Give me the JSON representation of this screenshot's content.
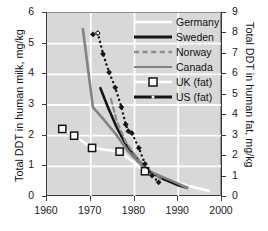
{
  "chart_data": {
    "type": "line",
    "title": "",
    "xlabel": "",
    "ylabel": "Total DDT in human milk, mg/kg",
    "y2label": "Total DDT in human fat, mg/kg",
    "xlim": [
      1960,
      2000
    ],
    "ylim": [
      0,
      6
    ],
    "y2lim": [
      0,
      9
    ],
    "xticks": [
      "1960",
      "1970",
      "1980",
      "1990",
      "2000"
    ],
    "yticks": [
      "0",
      "1",
      "2",
      "3",
      "4",
      "5",
      "6"
    ],
    "y2ticks": [
      "0",
      "1",
      "2",
      "3",
      "4",
      "5",
      "6",
      "7",
      "8",
      "9"
    ],
    "grid": true,
    "legend_position": "top-right",
    "plot_background": "#d8d8d8",
    "gridline_color": "#ffffff",
    "series": [
      {
        "name": "Germany",
        "axis": "left",
        "style": "solid",
        "color": "#ffffff",
        "width": 2.6,
        "marker": "none",
        "points": [
          [
            1963.5,
            2.22
          ],
          [
            1966.2,
            2.0
          ],
          [
            1970.3,
            1.6
          ],
          [
            1976.6,
            1.48
          ],
          [
            1982.4,
            0.84
          ],
          [
            1985.5,
            0.7
          ],
          [
            1988.0,
            0.56
          ],
          [
            1991.0,
            0.42
          ],
          [
            1994.0,
            0.3
          ],
          [
            1997.0,
            0.2
          ]
        ]
      },
      {
        "name": "Sweden",
        "axis": "left",
        "style": "solid",
        "color": "#141414",
        "width": 2.6,
        "marker": "none",
        "points": [
          [
            1972.2,
            3.55
          ],
          [
            1974.0,
            2.9
          ],
          [
            1976.0,
            2.25
          ],
          [
            1978.0,
            1.72
          ],
          [
            1980.0,
            1.34
          ],
          [
            1982.0,
            1.02
          ],
          [
            1984.0,
            0.78
          ],
          [
            1986.0,
            0.62
          ],
          [
            1988.0,
            0.5
          ],
          [
            1990.0,
            0.38
          ],
          [
            1992.0,
            0.3
          ]
        ]
      },
      {
        "name": "Norway",
        "axis": "left",
        "style": "dashed",
        "color": "#8c8c8c",
        "width": 2.2,
        "marker": "none",
        "points": [
          [
            1974.6,
            3.2
          ],
          [
            1976.0,
            2.45
          ],
          [
            1978.0,
            1.8
          ],
          [
            1980.0,
            1.4
          ],
          [
            1982.0,
            1.02
          ],
          [
            1984.0,
            0.78
          ],
          [
            1986.0,
            0.58
          ]
        ]
      },
      {
        "name": "Canada",
        "axis": "left",
        "style": "solid",
        "color": "#838383",
        "width": 2.6,
        "marker": "none",
        "points": [
          [
            1968.2,
            5.48
          ],
          [
            1970.5,
            2.92
          ],
          [
            1973.0,
            2.52
          ],
          [
            1976.0,
            2.0
          ],
          [
            1978.5,
            1.5
          ],
          [
            1981.0,
            1.12
          ],
          [
            1983.0,
            0.86
          ],
          [
            1986.0,
            0.68
          ],
          [
            1989.0,
            0.5
          ],
          [
            1992.0,
            0.3
          ]
        ]
      },
      {
        "name": "UK (fat)",
        "axis": "left",
        "style": "none",
        "color": "#141414",
        "width": 1.4,
        "marker": "square-open",
        "points": [
          [
            1963.5,
            2.22
          ],
          [
            1966.2,
            2.0
          ],
          [
            1970.3,
            1.6
          ],
          [
            1976.6,
            1.48
          ],
          [
            1982.4,
            0.84
          ]
        ]
      },
      {
        "name": "US (fat)",
        "axis": "right",
        "style": "dash-dot",
        "color": "#141414",
        "width": 2.4,
        "marker": "diamond",
        "points": [
          [
            1970.5,
            7.95
          ],
          [
            1971.6,
            8.02
          ],
          [
            1972.8,
            7.0
          ],
          [
            1974.2,
            6.1
          ],
          [
            1975.6,
            5.35
          ],
          [
            1977.0,
            4.4
          ],
          [
            1978.0,
            3.55
          ],
          [
            1978.6,
            3.22
          ],
          [
            1979.4,
            3.12
          ],
          [
            1981.0,
            2.4
          ],
          [
            1982.4,
            1.62
          ],
          [
            1984.0,
            1.05
          ],
          [
            1985.5,
            0.72
          ]
        ]
      }
    ]
  },
  "axes": {
    "y_title": "Total DDT in human milk, mg/kg",
    "y2_title": "Total DDT in human fat, mg/kg",
    "x_ticks": [
      "1960",
      "1970",
      "1980",
      "1990",
      "2000"
    ],
    "y_ticks": [
      "6",
      "5",
      "4",
      "3",
      "2",
      "1",
      "0"
    ],
    "y2_ticks": [
      "9",
      "8",
      "7",
      "6",
      "5",
      "4",
      "3",
      "2",
      "1",
      "0"
    ]
  },
  "legend": {
    "items": [
      {
        "label": "Germany",
        "key": "germany"
      },
      {
        "label": "Sweden",
        "key": "sweden"
      },
      {
        "label": "Norway",
        "key": "norway"
      },
      {
        "label": "Canada",
        "key": "canada"
      },
      {
        "label": "UK (fat)",
        "key": "uk-fat"
      },
      {
        "label": "US (fat)",
        "key": "us-fat"
      }
    ]
  }
}
